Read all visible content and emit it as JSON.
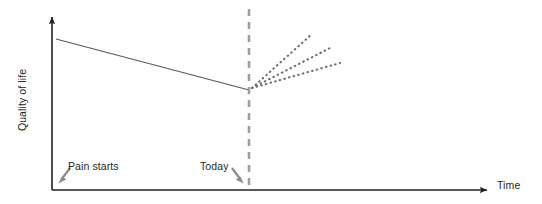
{
  "figure": {
    "background_color": "#ffffff",
    "width": 542,
    "height": 204
  },
  "axes": {
    "y_label": "Quality of life",
    "x_label": "Time",
    "axis_color": "#231f20",
    "origin": {
      "x": 52,
      "y": 190
    },
    "y_axis_top": 15,
    "x_axis_right": 490
  },
  "annotations": {
    "pain_starts": {
      "label": "Pain starts",
      "arrow_direction": "down-left",
      "arrow_color": "#7d7d7d"
    },
    "today": {
      "label": "Today",
      "arrow_direction": "down-right",
      "arrow_color": "#7d7d7d"
    },
    "today_marker": {
      "name": "today-dashed-line",
      "color": "#9e9e9e",
      "style": "dashed",
      "x": 249
    }
  },
  "chart_data": {
    "type": "line",
    "title": "",
    "xlabel": "Time",
    "ylabel": "Quality of life",
    "grid": false,
    "legend": null,
    "axis_ticks": {
      "x": [],
      "y": []
    },
    "xlim": [
      0,
      100
    ],
    "ylim": [
      0,
      100
    ],
    "series": [
      {
        "name": "observed-decline",
        "style": "solid",
        "color": "#595959",
        "points": [
          {
            "x": 56,
            "y": 39
          },
          {
            "x": 249,
            "y": 90
          }
        ]
      },
      {
        "name": "projection-best",
        "style": "dotted",
        "color": "#6e6e6e",
        "points": [
          {
            "x": 252,
            "y": 88
          },
          {
            "x": 312,
            "y": 34
          }
        ]
      },
      {
        "name": "projection-middle",
        "style": "dotted",
        "color": "#6e6e6e",
        "points": [
          {
            "x": 252,
            "y": 88
          },
          {
            "x": 332,
            "y": 47
          }
        ]
      },
      {
        "name": "projection-lower",
        "style": "dotted",
        "color": "#6e6e6e",
        "points": [
          {
            "x": 252,
            "y": 88
          },
          {
            "x": 340,
            "y": 63
          }
        ]
      }
    ]
  }
}
